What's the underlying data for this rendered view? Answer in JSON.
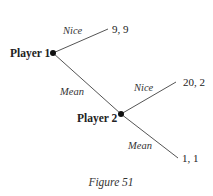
{
  "figure": {
    "caption": "Figure 51",
    "type": "game-tree"
  },
  "nodes": [
    {
      "id": "p1",
      "label": "Player 1",
      "x": 53,
      "y": 53
    },
    {
      "id": "p2",
      "label": "Player 2",
      "x": 121,
      "y": 114
    }
  ],
  "edges": [
    {
      "from": "p1",
      "action": "Nice",
      "to_payoff": "9, 9"
    },
    {
      "from": "p1",
      "action": "Mean",
      "to": "p2"
    },
    {
      "from": "p2",
      "action": "Nice",
      "to_payoff": "20, 2"
    },
    {
      "from": "p2",
      "action": "Mean",
      "to_payoff": "1, 1"
    }
  ],
  "labels": {
    "player1": "Player 1",
    "player2": "Player 2",
    "p1_nice": "Nice",
    "p1_mean": "Mean",
    "p2_nice": "Nice",
    "p2_mean": "Mean",
    "payoff_p1_nice": "9, 9",
    "payoff_p2_nice": "20, 2",
    "payoff_p2_mean": "1, 1"
  },
  "colors": {
    "edge": "#555555",
    "node": "#111111",
    "text": "#222222",
    "background": "#ffffff"
  }
}
